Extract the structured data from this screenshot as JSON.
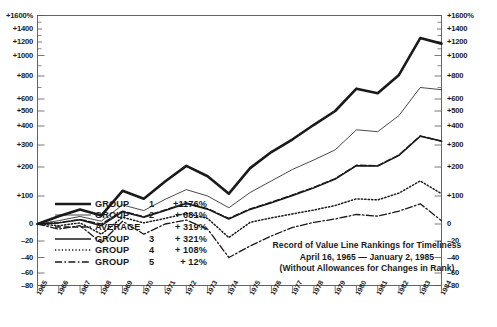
{
  "chart_data": {
    "type": "line",
    "title": "Record of Value Line Rankings for Timeliness",
    "subtitle": "April 16, 1965 — January 2, 1985",
    "note": "(Without Allowances for Changes in Rank)",
    "xlabel": "",
    "ylabel": "",
    "grid": false,
    "legend_position": "lower-left",
    "axis_scale": "split-log",
    "ylim": [
      -80,
      1600
    ],
    "x": [
      1965,
      1966,
      1967,
      1968,
      1969,
      1970,
      1971,
      1972,
      1973,
      1974,
      1975,
      1976,
      1977,
      1978,
      1979,
      1980,
      1981,
      1982,
      1983,
      1984
    ],
    "categories": [
      "1965",
      "1966",
      "1967",
      "1968",
      "1969",
      "1970",
      "1971",
      "1972",
      "1973",
      "1974",
      "1975",
      "1976",
      "1977",
      "1978",
      "1979",
      "1980",
      "1981",
      "1982",
      "1983",
      "1984"
    ],
    "y_ticks": [
      1600,
      1400,
      1200,
      1000,
      800,
      600,
      500,
      400,
      300,
      200,
      100,
      0,
      -20,
      -40,
      -60,
      -80
    ],
    "y_tick_labels_left": [
      "+1600%",
      "+1400",
      "+1200",
      "+1000",
      "+800",
      "+600",
      "+500",
      "+400",
      "+300",
      "+200",
      "+100",
      "0",
      "–20",
      "–40",
      "–60",
      "–80"
    ],
    "y_tick_labels_right": [
      "+1600%",
      "+1400",
      "+1200",
      "+1000",
      "+800",
      "+600",
      "+500",
      "+400",
      "+300",
      "+200",
      "+100",
      "0",
      "–20",
      "–40",
      "–60",
      "–80"
    ],
    "series": [
      {
        "name": "GROUP 1",
        "total": "+1176%",
        "style": "solid-thick",
        "values": [
          0,
          28,
          52,
          30,
          118,
          90,
          150,
          205,
          168,
          108,
          196,
          268,
          330,
          408,
          500,
          690,
          650,
          810,
          1260,
          1176
        ]
      },
      {
        "name": "GROUP 2",
        "total": "+ 681%",
        "style": "solid-thin",
        "values": [
          0,
          12,
          27,
          10,
          68,
          48,
          88,
          122,
          100,
          58,
          112,
          152,
          192,
          232,
          278,
          380,
          370,
          470,
          700,
          681
        ]
      },
      {
        "name": "AVERAGE",
        "total": "+ 319%",
        "style": "dashed",
        "values": [
          0,
          5,
          16,
          0,
          46,
          26,
          50,
          75,
          55,
          20,
          54,
          78,
          104,
          130,
          160,
          208,
          206,
          255,
          348,
          319
        ]
      },
      {
        "name": "GROUP 3",
        "total": "+ 321%",
        "style": "solid-medium",
        "values": [
          0,
          4,
          15,
          -2,
          44,
          24,
          48,
          73,
          53,
          18,
          52,
          76,
          102,
          128,
          158,
          206,
          204,
          253,
          346,
          321
        ]
      },
      {
        "name": "GROUP 4",
        "total": "+ 108%",
        "style": "dotted",
        "values": [
          0,
          -2,
          4,
          -12,
          24,
          4,
          20,
          38,
          20,
          -16,
          6,
          22,
          36,
          50,
          66,
          90,
          86,
          110,
          152,
          108
        ]
      },
      {
        "name": "GROUP 5",
        "total": "+  12%",
        "style": "dash-dot",
        "values": [
          0,
          -6,
          -2,
          -22,
          10,
          -12,
          0,
          14,
          -6,
          -40,
          -26,
          -14,
          -4,
          6,
          18,
          34,
          28,
          46,
          72,
          12
        ]
      }
    ]
  },
  "legend": {
    "rows": [
      {
        "name": "GROUP",
        "num": "1",
        "value": "+1176%",
        "style": "solid-thick"
      },
      {
        "name": "GROUP",
        "num": "2",
        "value": "+ 681%",
        "style": "solid-thin"
      },
      {
        "name": "AVERAGE",
        "num": "",
        "value": "+ 319%",
        "style": "dashed"
      },
      {
        "name": "GROUP",
        "num": "3",
        "value": "+ 321%",
        "style": "solid-medium"
      },
      {
        "name": "GROUP",
        "num": "4",
        "value": "+ 108%",
        "style": "dotted"
      },
      {
        "name": "GROUP",
        "num": "5",
        "value": "+  12%",
        "style": "dash-dot"
      }
    ]
  },
  "titleblock": {
    "line1": "Record of Value Line Rankings for Timeliness",
    "line2": "April 16, 1965 — January 2, 1985",
    "line3": "(Without Allowances for Changes in Rank)"
  },
  "colors": {
    "ink": "#1a1a1a",
    "frame": "#555555",
    "background": "#ffffff"
  }
}
